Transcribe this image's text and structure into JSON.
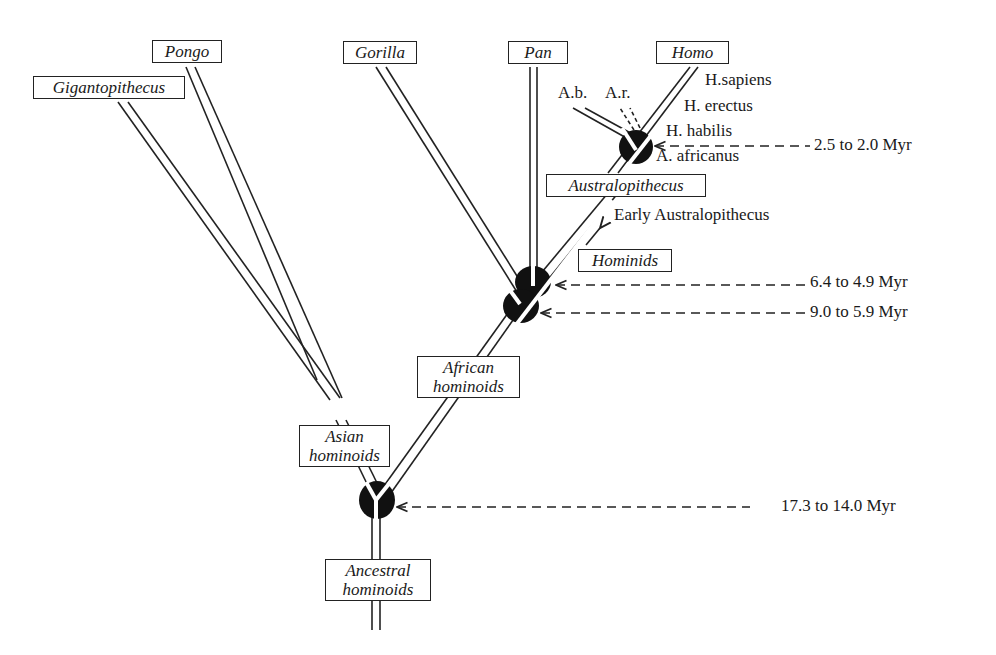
{
  "diagram": {
    "type": "phylogenetic-tree",
    "taxa": {
      "gigantopithecus": "Gigantopithecus",
      "pongo": "Pongo",
      "gorilla": "Gorilla",
      "pan": "Pan",
      "homo": "Homo",
      "australopithecus": "Australopithecus",
      "hominids": "Hominids",
      "african_hominoids_1": "African",
      "african_hominoids_2": "hominoids",
      "asian_hominoids_1": "Asian",
      "asian_hominoids_2": "hominoids",
      "ancestral_hominoids_1": "Ancestral",
      "ancestral_hominoids_2": "hominoids"
    },
    "species": {
      "ab": "A.b.",
      "ar": "A.r.",
      "h_sapiens": "H.sapiens",
      "h_erectus": "H. erectus",
      "h_habilis": "H. habilis",
      "a_africanus": "A. africanus",
      "early_australopithecus": "Early Australopithecus"
    },
    "dates": [
      {
        "node": "homo-australopithecus split",
        "label": "2.5 to 2.0 Myr"
      },
      {
        "node": "pan-hominid split",
        "label": "6.4 to 4.9 Myr"
      },
      {
        "node": "gorilla split",
        "label": "9.0 to 5.9 Myr"
      },
      {
        "node": "asian-african hominoid split",
        "label": "17.3 to 14.0 Myr"
      }
    ]
  }
}
